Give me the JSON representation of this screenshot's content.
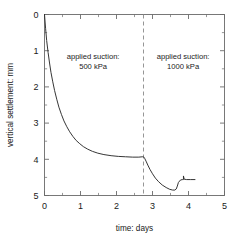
{
  "chart_data": {
    "type": "line",
    "title": "",
    "subtitle": "",
    "xlabel": "time: days",
    "ylabel": "vertical settlement: mm",
    "xlim": [
      0,
      5
    ],
    "ylim": [
      0,
      5
    ],
    "y_inverted": true,
    "grid": false,
    "legend_position": "none",
    "x_ticks": [
      0,
      1,
      2,
      3,
      4,
      5
    ],
    "x_tick_labels": [
      "0",
      "1",
      "2",
      "3",
      "4",
      "5"
    ],
    "x_minor_ticks": [
      0.5,
      1.5,
      2.5,
      3.5,
      4.5
    ],
    "y_ticks": [
      0,
      1,
      2,
      3,
      4,
      5
    ],
    "y_tick_labels": [
      "0",
      "1",
      "2",
      "3",
      "4",
      "5"
    ],
    "y_minor_ticks": [
      0.5,
      1.5,
      2.5,
      3.5,
      4.5
    ],
    "series": [
      {
        "name": "vertical settlement",
        "x": [
          0.0,
          0.03,
          0.06,
          0.1,
          0.14,
          0.18,
          0.23,
          0.28,
          0.34,
          0.4,
          0.47,
          0.54,
          0.62,
          0.7,
          0.79,
          0.88,
          0.98,
          1.08,
          1.2,
          1.33,
          1.48,
          1.65,
          1.85,
          2.05,
          2.25,
          2.45,
          2.62,
          2.72,
          2.75,
          2.78,
          2.82,
          2.87,
          2.93,
          3.0,
          3.08,
          3.17,
          3.27,
          3.38,
          3.48,
          3.56,
          3.62,
          3.66,
          3.69,
          3.72,
          3.78,
          3.84,
          3.86,
          3.86,
          3.88,
          3.95,
          4.05,
          4.18
        ],
        "y": [
          0.0,
          0.38,
          0.72,
          1.05,
          1.34,
          1.6,
          1.86,
          2.1,
          2.34,
          2.56,
          2.76,
          2.94,
          3.1,
          3.24,
          3.37,
          3.48,
          3.57,
          3.65,
          3.72,
          3.78,
          3.83,
          3.87,
          3.9,
          3.92,
          3.93,
          3.94,
          3.94,
          3.93,
          3.93,
          3.97,
          4.05,
          4.16,
          4.28,
          4.4,
          4.52,
          4.62,
          4.71,
          4.78,
          4.83,
          4.85,
          4.85,
          4.82,
          4.74,
          4.64,
          4.57,
          4.56,
          4.56,
          4.46,
          4.55,
          4.56,
          4.56,
          4.56
        ]
      }
    ],
    "annotations": [
      {
        "name": "stage-1-label",
        "line1": "applied suction:",
        "line2": "500 kPa",
        "x": 1.35,
        "y": 1.22
      },
      {
        "name": "stage-2-label",
        "line1": "applied suction:",
        "line2": "1000 kPa",
        "x": 3.85,
        "y": 1.22
      }
    ],
    "vertical_line": {
      "name": "suction-stage-divider",
      "x": 2.75,
      "style": "dashed"
    },
    "colors": {
      "curve": "#2b2b2b",
      "axis": "#6b6b6b",
      "divider": "#8a8a8a",
      "text": "#1a1a1a",
      "background": "#ffffff"
    }
  }
}
